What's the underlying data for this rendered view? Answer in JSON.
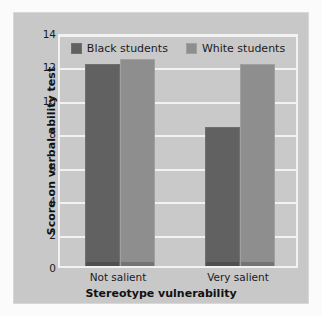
{
  "chart_data": {
    "type": "bar",
    "title": "",
    "xlabel": "Stereotype vulnerability",
    "ylabel": "Score on verbal ability test",
    "categories": [
      "Not salient",
      "Very salient"
    ],
    "series": [
      {
        "name": "Black students",
        "values": [
          12.1,
          8.3
        ],
        "color": "#616161"
      },
      {
        "name": "White students",
        "values": [
          12.4,
          12.1
        ],
        "color": "#8e8e8e"
      }
    ],
    "ylim": [
      0,
      14
    ],
    "yticks": [
      0,
      2,
      4,
      6,
      8,
      10,
      12,
      14
    ],
    "grid": true,
    "legend_position": "top-center",
    "colors": {
      "figure_background": "#c8c8c8",
      "plot_background": "#c9c9c9",
      "gridline": "#f2f2f2",
      "page_background": "#fbfbfb",
      "text": "#1b1b1b"
    }
  }
}
